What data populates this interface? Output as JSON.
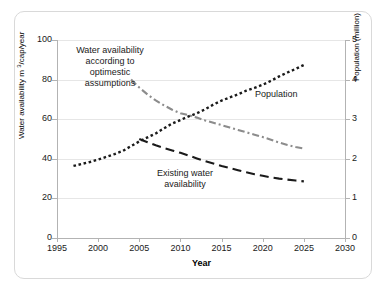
{
  "chart_data": {
    "type": "line",
    "title": "",
    "xlabel": "Year",
    "ylabel": "Water availability m 3/cap/year",
    "ylabel_secondary": "Population (million)",
    "xlim": [
      1995,
      2030
    ],
    "ylim": [
      0,
      100
    ],
    "ylim_secondary": [
      0,
      5
    ],
    "xticks": [
      "1995",
      "2000",
      "2005",
      "2010",
      "2015",
      "2020",
      "2025",
      "2030"
    ],
    "yticks": [
      "0",
      "20",
      "40",
      "60",
      "80",
      "100"
    ],
    "yticks_secondary": [
      "0",
      "1",
      "2",
      "3",
      "4",
      "5"
    ],
    "grid": true,
    "legend_position": "inline-annotations",
    "series": [
      {
        "name": "Population",
        "axis": "right",
        "style": "dotted",
        "color": "#1a1a1a",
        "annotation": "Population",
        "x": [
          1997,
          1998,
          1999,
          2000,
          2001,
          2002,
          2003,
          2004,
          2005,
          2006,
          2007,
          2008,
          2009,
          2010,
          2011,
          2012,
          2013,
          2014,
          2015,
          2016,
          2017,
          2018,
          2019,
          2020,
          2021,
          2022,
          2023,
          2024,
          2025
        ],
        "values": [
          1.82,
          1.87,
          1.92,
          1.98,
          2.05,
          2.12,
          2.2,
          2.32,
          2.44,
          2.54,
          2.64,
          2.77,
          2.89,
          2.98,
          3.07,
          3.15,
          3.25,
          3.37,
          3.47,
          3.55,
          3.63,
          3.72,
          3.79,
          3.87,
          3.97,
          4.08,
          4.18,
          4.27,
          4.37
        ]
      },
      {
        "name": "Existing water availability",
        "axis": "left",
        "style": "dashed",
        "color": "#1a1a1a",
        "annotation": "Existing water availability",
        "x": [
          2005,
          2006,
          2007,
          2008,
          2009,
          2010,
          2011,
          2012,
          2013,
          2014,
          2015,
          2016,
          2017,
          2018,
          2019,
          2020,
          2021,
          2022,
          2023,
          2024,
          2025
        ],
        "values": [
          50.0,
          48.4,
          46.8,
          45.4,
          44.2,
          43.0,
          41.6,
          40.2,
          38.8,
          37.6,
          36.4,
          35.3,
          34.2,
          33.2,
          32.2,
          31.4,
          30.6,
          30.0,
          29.5,
          29.0,
          28.6
        ]
      },
      {
        "name": "Water availability according to optimestic assumptions",
        "axis": "left",
        "style": "dash-dot",
        "color": "#8c8c8c",
        "annotation": "Water availability according to optimestic assumptions",
        "x": [
          2004,
          2005,
          2006,
          2007,
          2008,
          2009,
          2010,
          2011,
          2012,
          2013,
          2014,
          2015,
          2016,
          2017,
          2018,
          2019,
          2020,
          2021,
          2022,
          2023,
          2024,
          2025
        ],
        "values": [
          80.0,
          76.0,
          72.5,
          69.5,
          67.0,
          64.8,
          63.0,
          62.0,
          60.8,
          59.4,
          58.2,
          57.0,
          55.8,
          54.6,
          53.4,
          52.2,
          51.0,
          49.6,
          48.2,
          47.0,
          46.0,
          45.2
        ]
      }
    ]
  },
  "annotations": {
    "optimistic_line1": "Water availability",
    "optimistic_line2": "according to",
    "optimistic_line3": "optimestic",
    "optimistic_line4": "assumptions",
    "existing_line1": "Existing water",
    "existing_line2": "availability",
    "population": "Population"
  },
  "axes": {
    "x_title": "Year",
    "y_title_prefix": "Water availability m ",
    "y_title_sup": "3",
    "y_title_suffix": "/cap/year",
    "y2_title": "Population (million)"
  }
}
